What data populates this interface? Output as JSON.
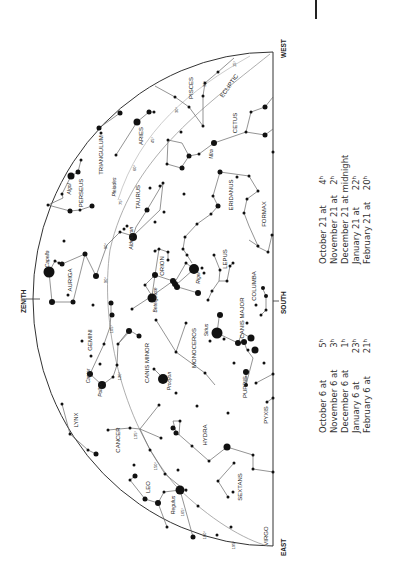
{
  "chart": {
    "orientation": "rotated 90 degrees counter-clockwise",
    "directions": {
      "zenith": "ZENITH",
      "south": "SOUTH",
      "east": "EAST",
      "west": "WEST"
    },
    "ecliptic_label": "ECLIPTIC",
    "constellations": [
      {
        "name": "PISCES",
        "x": 193,
        "y": 88
      },
      {
        "name": "CETUS",
        "x": 237,
        "y": 123
      },
      {
        "name": "TRIANGULUM",
        "x": 103,
        "y": 155
      },
      {
        "name": "ARIES",
        "x": 143,
        "y": 136
      },
      {
        "name": "PERSEUS",
        "x": 83,
        "y": 193
      },
      {
        "name": "TAURUS",
        "x": 140,
        "y": 197
      },
      {
        "name": "ERIDANUS",
        "x": 233,
        "y": 195
      },
      {
        "name": "FORMAX",
        "x": 266,
        "y": 214
      },
      {
        "name": "AURIGA",
        "x": 72,
        "y": 280
      },
      {
        "name": "ORION",
        "x": 164,
        "y": 266
      },
      {
        "name": "LEPUS",
        "x": 227,
        "y": 259
      },
      {
        "name": "COLUMBA",
        "x": 256,
        "y": 286
      },
      {
        "name": "GEMINI",
        "x": 92,
        "y": 340
      },
      {
        "name": "MONOCEROS",
        "x": 196,
        "y": 348
      },
      {
        "name": "CANIS MAJOR",
        "x": 244,
        "y": 318
      },
      {
        "name": "CANIS MINOR",
        "x": 149,
        "y": 363
      },
      {
        "name": "PUPPIS",
        "x": 247,
        "y": 387
      },
      {
        "name": "LYNX",
        "x": 78,
        "y": 420
      },
      {
        "name": "CANCER",
        "x": 120,
        "y": 440
      },
      {
        "name": "HYDRA",
        "x": 207,
        "y": 435
      },
      {
        "name": "PYXIS",
        "x": 268,
        "y": 415
      },
      {
        "name": "LEO",
        "x": 150,
        "y": 487
      },
      {
        "name": "SEXTANS",
        "x": 242,
        "y": 487
      },
      {
        "name": "VIRGO",
        "x": 268,
        "y": 536
      }
    ],
    "star_names": [
      {
        "name": "Algol",
        "x": 71,
        "y": 189
      },
      {
        "name": "Pleiades",
        "x": 116,
        "y": 187
      },
      {
        "name": "Aldebaran",
        "x": 133,
        "y": 238
      },
      {
        "name": "Capella",
        "x": 49,
        "y": 259
      },
      {
        "name": "Rigel",
        "x": 200,
        "y": 278
      },
      {
        "name": "Betelgeuse",
        "x": 157,
        "y": 300
      },
      {
        "name": "Mira",
        "x": 213,
        "y": 154
      },
      {
        "name": "Sirius",
        "x": 208,
        "y": 330
      },
      {
        "name": "Castor",
        "x": 90,
        "y": 376
      },
      {
        "name": "Pollux",
        "x": 102,
        "y": 390
      },
      {
        "name": "Procyon",
        "x": 171,
        "y": 381
      },
      {
        "name": "Regulus",
        "x": 175,
        "y": 505
      }
    ],
    "ecliptic_degrees": [
      {
        "label": "15°",
        "x": 236,
        "y": 64
      },
      {
        "label": "30°",
        "x": 206,
        "y": 84
      },
      {
        "label": "30°",
        "x": 178,
        "y": 110
      },
      {
        "label": "45°",
        "x": 154,
        "y": 140
      },
      {
        "label": "60°",
        "x": 136,
        "y": 168
      },
      {
        "label": "75°",
        "x": 122,
        "y": 202
      },
      {
        "label": "90°",
        "x": 107,
        "y": 246
      },
      {
        "label": "90°",
        "x": 107,
        "y": 280
      },
      {
        "label": "105°",
        "x": 113,
        "y": 329
      },
      {
        "label": "120°",
        "x": 121,
        "y": 376
      },
      {
        "label": "135°",
        "x": 137,
        "y": 435
      },
      {
        "label": "150°",
        "x": 157,
        "y": 466
      },
      {
        "label": "165°",
        "x": 184,
        "y": 512
      },
      {
        "label": "180°",
        "x": 206,
        "y": 535
      },
      {
        "label": "195°",
        "x": 235,
        "y": 545
      }
    ]
  },
  "schedule": {
    "left_column": [
      {
        "date": "October 6 at",
        "time": "5ʰ"
      },
      {
        "date": "November 6 at",
        "time": "3ʰ"
      },
      {
        "date": "December 6 at",
        "time": "1ʰ"
      },
      {
        "date": "January 6 at",
        "time": "23ʰ"
      },
      {
        "date": "February 6 at",
        "time": "21ʰ"
      }
    ],
    "right_column": [
      {
        "date": "October 21 at",
        "time": "4ʰ"
      },
      {
        "date": "November 21 at",
        "time": "2ʰ"
      },
      {
        "date": "December 21 at midnight",
        "time": ""
      },
      {
        "date": "January 21 at",
        "time": "22ʰ"
      },
      {
        "date": "February 21 at",
        "time": "20ʰ"
      }
    ]
  },
  "colors": {
    "ink": "#222222",
    "line": "#777777",
    "background": "#ffffff"
  }
}
